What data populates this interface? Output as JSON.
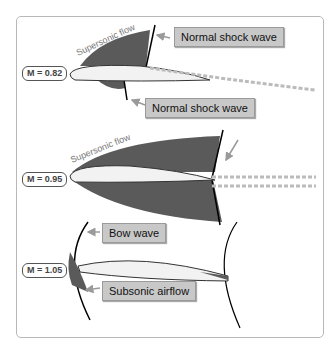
{
  "diagram": {
    "panels": [
      {
        "mach_label": "M = 0.82",
        "flow_label": "Supersonic flow",
        "callouts": [
          "Normal shock wave",
          "Normal shock wave"
        ]
      },
      {
        "mach_label": "M = 0.95",
        "flow_label": "Supersonic flow",
        "callouts": []
      },
      {
        "mach_label": "M = 1.05",
        "callouts": [
          "Bow wave",
          "Subsonic airflow"
        ]
      }
    ],
    "colors": {
      "shock_region": "#5a5a5a",
      "airfoil": "#f2f2f2",
      "callout_bg": "#c8c8c8",
      "frame": "#b8b8b8"
    }
  }
}
